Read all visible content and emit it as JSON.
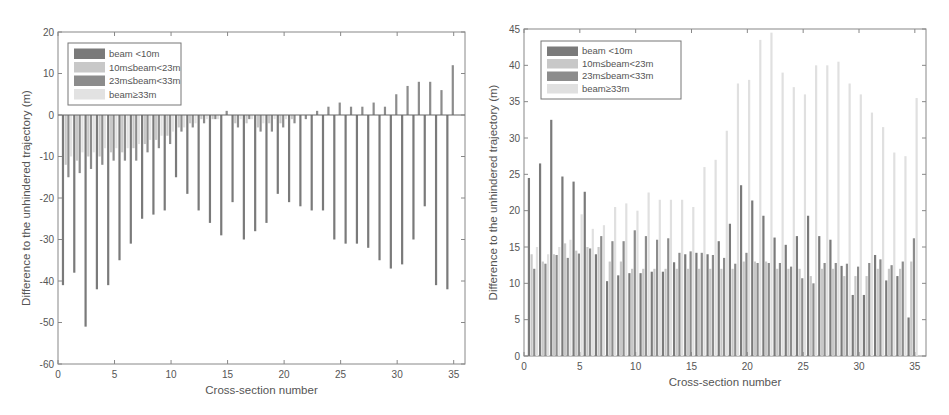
{
  "chart_data": [
    {
      "type": "bar",
      "title": "",
      "xlabel": "Cross-section number",
      "ylabel": "Difference to the unhindered trajectory (m)",
      "xlim": [
        0,
        36
      ],
      "ylim": [
        -60,
        20
      ],
      "xticks": [
        0,
        5,
        10,
        15,
        20,
        25,
        30,
        35
      ],
      "yticks": [
        -60,
        -50,
        -40,
        -30,
        -20,
        -10,
        0,
        10,
        20
      ],
      "grid": false,
      "legend_position": "upper-left",
      "categories": [
        1,
        2,
        3,
        4,
        5,
        6,
        7,
        8,
        9,
        10,
        11,
        12,
        13,
        14,
        15,
        16,
        17,
        18,
        19,
        20,
        21,
        22,
        23,
        24,
        25,
        26,
        27,
        28,
        29,
        30,
        31,
        32,
        33,
        34,
        35
      ],
      "series": [
        {
          "name": "beam <10m",
          "color": "#7a7a7a",
          "values": [
            -41,
            -38,
            -51,
            -42,
            -41,
            -35,
            -31,
            -25,
            -24,
            -23,
            -15,
            -19,
            -23,
            -26,
            -29,
            -21,
            -30,
            -28,
            -26,
            -19,
            -21,
            -22,
            -23,
            -23,
            -30,
            -31,
            -31,
            -32,
            -35,
            -37,
            -36,
            -30,
            -22,
            -41,
            -42
          ]
        },
        {
          "name": "10m≤beam<23m",
          "color": "#c8c8c8",
          "values": [
            -12,
            -11,
            -10,
            -10,
            -9,
            -9,
            -8,
            -7,
            -6,
            -5,
            -3,
            -2,
            -1,
            -1,
            0,
            -2,
            -2,
            -3,
            -2,
            -2,
            -1,
            0,
            0,
            0,
            0,
            0,
            0,
            0,
            0,
            0,
            0,
            0,
            0,
            0,
            0
          ]
        },
        {
          "name": "23m≤beam<33m",
          "color": "#8c8c8c",
          "values": [
            -15,
            -14,
            -13,
            -12,
            -11,
            -11,
            -11,
            -9,
            -8,
            -7,
            -4,
            -3,
            -2,
            -1,
            1,
            -3,
            -1,
            -4,
            -4,
            -3,
            -2,
            -1,
            1,
            2,
            3,
            2,
            2,
            3,
            2,
            5,
            7,
            8,
            8,
            6,
            12
          ]
        },
        {
          "name": "beam≥33m",
          "color": "#e2e2e2",
          "values": [
            -10,
            -9,
            -9,
            -8,
            -8,
            -8,
            -7,
            -6,
            -5,
            -4,
            -3,
            -2,
            -1,
            -1,
            0,
            -1,
            -1,
            -2,
            -1,
            -1,
            0,
            0,
            0,
            0,
            0,
            0,
            0,
            0,
            0,
            0,
            0,
            0,
            0,
            0,
            0
          ]
        }
      ]
    },
    {
      "type": "bar",
      "title": "",
      "xlabel": "Cross-section number",
      "ylabel": "Difference to the unhindered trajectory (m)",
      "xlim": [
        0,
        36
      ],
      "ylim": [
        0,
        45
      ],
      "xticks": [
        0,
        5,
        10,
        15,
        20,
        25,
        30,
        35
      ],
      "yticks": [
        0,
        5,
        10,
        15,
        20,
        25,
        30,
        35,
        40,
        45
      ],
      "grid": false,
      "legend_position": "upper-left",
      "categories": [
        1,
        2,
        3,
        4,
        5,
        6,
        7,
        8,
        9,
        10,
        11,
        12,
        13,
        14,
        15,
        16,
        17,
        18,
        19,
        20,
        21,
        22,
        23,
        24,
        25,
        26,
        27,
        28,
        29,
        30,
        31,
        32,
        33,
        34,
        35
      ],
      "series": [
        {
          "name": "beam <10m",
          "color": "#7a7a7a",
          "values": [
            24.5,
            26.5,
            32.5,
            24.7,
            24,
            22.6,
            14,
            10.3,
            11.1,
            11.4,
            11.4,
            11.6,
            11.6,
            12.9,
            14,
            14.2,
            14,
            15.8,
            18.2,
            23.5,
            21.4,
            19.3,
            16.3,
            15.3,
            16.5,
            19.3,
            16.5,
            16,
            12.4,
            8.4,
            8.4,
            13.9,
            10.4,
            11,
            5.3
          ]
        },
        {
          "name": "10m≤beam<23m",
          "color": "#c8c8c8",
          "values": [
            14,
            13,
            14,
            15.5,
            14.5,
            15,
            15,
            13,
            13,
            12,
            12,
            12,
            12,
            12,
            12,
            12,
            12,
            12,
            12,
            13,
            13,
            13,
            12,
            12,
            12,
            11,
            12,
            12,
            11,
            11,
            11,
            12,
            12,
            12,
            13
          ]
        },
        {
          "name": "23m≤beam<33m",
          "color": "#8c8c8c",
          "values": [
            12,
            12.7,
            13.9,
            13.5,
            14.1,
            14.8,
            16.5,
            15.8,
            15.8,
            17.3,
            16.5,
            16,
            16.2,
            14.2,
            14.4,
            14.2,
            13.9,
            13.5,
            12.7,
            14.2,
            12.8,
            12.8,
            12.8,
            12.3,
            10.7,
            10,
            12.8,
            12.8,
            12.7,
            12.3,
            12.8,
            13.3,
            12.5,
            13,
            16.2
          ]
        },
        {
          "name": "beam≥33m",
          "color": "#e0e0e0",
          "values": [
            15,
            14,
            15,
            16,
            19.5,
            17.5,
            18,
            20.5,
            21,
            20,
            22.5,
            21.5,
            21.5,
            21.5,
            20.5,
            26,
            27,
            31,
            37.5,
            38,
            43.5,
            44.5,
            39,
            37,
            36,
            40,
            40,
            40.5,
            37.5,
            36,
            33.5,
            31.5,
            28,
            27.5,
            35.5
          ]
        }
      ]
    }
  ],
  "legend": {
    "items": [
      "beam <10m",
      "10m≤beam<23m",
      "23m≤beam<33m",
      "beam≥33m"
    ]
  },
  "left_chart": {
    "xlabel": "Cross-section number",
    "ylabel": "Difference to the unhindered trajectory (m)"
  },
  "right_chart": {
    "xlabel": "Cross-section number",
    "ylabel": "Difference to the unhindered trajectory (m)"
  }
}
